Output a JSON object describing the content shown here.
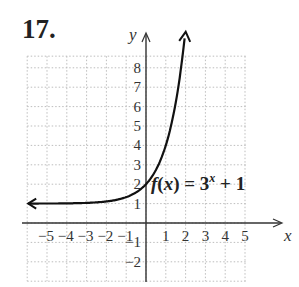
{
  "problem": {
    "number": "17."
  },
  "chart_data": {
    "type": "line",
    "title": "",
    "function_label": {
      "name": "f",
      "var": "x",
      "base": "3",
      "exponent": "x",
      "constant": "+ 1"
    },
    "xlabel": "x",
    "ylabel": "y",
    "xlim": [
      -6,
      5.5
    ],
    "ylim": [
      -3,
      8.6
    ],
    "x_ticks": [
      "-5",
      "-4",
      "-3",
      "-2",
      "-1",
      "1",
      "2",
      "3",
      "4",
      "5"
    ],
    "y_ticks": [
      "8",
      "7",
      "6",
      "5",
      "4",
      "3",
      "2",
      "1",
      "-1",
      "-2"
    ],
    "grid": true,
    "grid_style": "dotted",
    "series": [
      {
        "name": "f(x) = 3^x + 1",
        "x": [
          -6,
          -5,
          -4,
          -3,
          -2,
          -1,
          0,
          0.5,
          1,
          1.5,
          1.95
        ],
        "values": [
          1.001,
          1.004,
          1.012,
          1.037,
          1.111,
          1.333,
          2,
          2.732,
          4,
          6.196,
          9.5
        ],
        "horizontal_asymptote": 1,
        "arrows": "both"
      }
    ]
  },
  "colors": {
    "curve": "#111111",
    "axis": "#333333",
    "grid": "#bdbdbd",
    "text": "#222222"
  }
}
